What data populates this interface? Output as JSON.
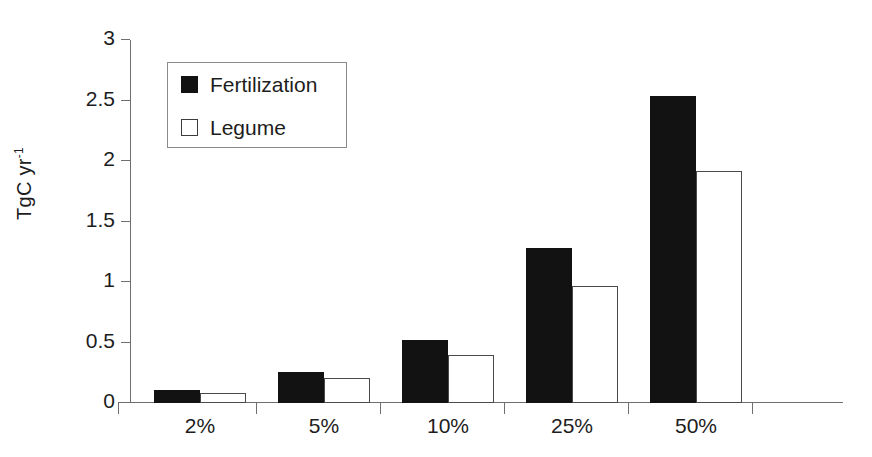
{
  "chart_data": {
    "type": "bar",
    "title": "",
    "xlabel": "",
    "ylabel": "TgC yr-1",
    "ylabel_base": "TgC yr",
    "ylabel_exponent": "-1",
    "categories": [
      "2%",
      "5%",
      "10%",
      "25%",
      "50%"
    ],
    "series": [
      {
        "name": "Fertilization",
        "color": "#121212",
        "values": [
          0.11,
          0.26,
          0.52,
          1.28,
          2.54
        ]
      },
      {
        "name": "Legume",
        "color": "#ffffff",
        "values": [
          0.08,
          0.21,
          0.4,
          0.97,
          1.92
        ]
      }
    ],
    "ylim": [
      0,
      3
    ],
    "ytick_values": [
      0,
      0.5,
      1,
      1.5,
      2,
      2.5,
      3
    ],
    "ytick_labels": [
      "0",
      "0.5",
      "1",
      "1.5",
      "2",
      "2.5",
      "3"
    ],
    "grid": false,
    "legend_position": "upper-left-inside"
  },
  "legend": {
    "items": [
      {
        "label": "Fertilization",
        "swatch": "filled-square-icon"
      },
      {
        "label": "Legume",
        "swatch": "outlined-square-icon"
      }
    ]
  }
}
